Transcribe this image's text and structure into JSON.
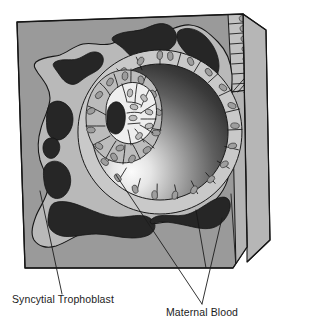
{
  "figure": {
    "background_color": "#ffffff"
  },
  "colors": {
    "endometrium_stroma": "#9a9a9a",
    "endometrium_block_side": "#b0b0b0",
    "endometrium_block_top": "#a6a6a6",
    "syncytial_trophoblast": "#b9b9b9",
    "maternal_blood": "#262626",
    "trophoblast_cell": "#c9c9c9",
    "trophoblast_nucleus": "#9e9e9e",
    "inner_cell_mass_cell": "#ececec",
    "inner_cell_mass_nucleus": "#b5b5b5",
    "blastocyst_cavity_dark": "#2a2a2a",
    "blastocyst_cavity_light": "#f2f2f2",
    "epithelium_cell": "#c4c4c4",
    "epithelium_nucleus": "#a0a0a0",
    "outline": "#161616",
    "label_text": "#1c1c1c"
  },
  "labels": [
    {
      "id": "syncytial-trophoblast",
      "text": "Syncytial Trophoblast",
      "x": 12,
      "y": 303,
      "anchor": "start"
    },
    {
      "id": "maternal-blood",
      "text": "Maternal Blood",
      "x": 166,
      "y": 316,
      "anchor": "start"
    }
  ],
  "leader_lines": [
    {
      "id": "leader-syncytial-trophoblast",
      "points": "40,191 62,294",
      "target": "syncytial-trophoblast"
    },
    {
      "id": "leader-maternal-blood-left",
      "points": "202,304 116,175",
      "target": "maternal-blood"
    },
    {
      "id": "leader-maternal-blood-right",
      "points": "202,304 222,218",
      "target": "maternal-blood"
    }
  ],
  "structures": [
    {
      "id": "endometrium-block",
      "name": "Endometrial tissue block"
    },
    {
      "id": "uterine-epithelium",
      "name": "Uterine surface epithelium"
    },
    {
      "id": "syncytial-trophoblast-zone",
      "name": "Syncytial trophoblast"
    },
    {
      "id": "maternal-blood-lacunae",
      "name": "Maternal blood lacunae"
    },
    {
      "id": "trophoblast-ring",
      "name": "Cytotrophoblast cell ring"
    },
    {
      "id": "inner-cell-mass",
      "name": "Inner cell mass"
    },
    {
      "id": "blastocyst-cavity",
      "name": "Blastocyst cavity"
    }
  ]
}
